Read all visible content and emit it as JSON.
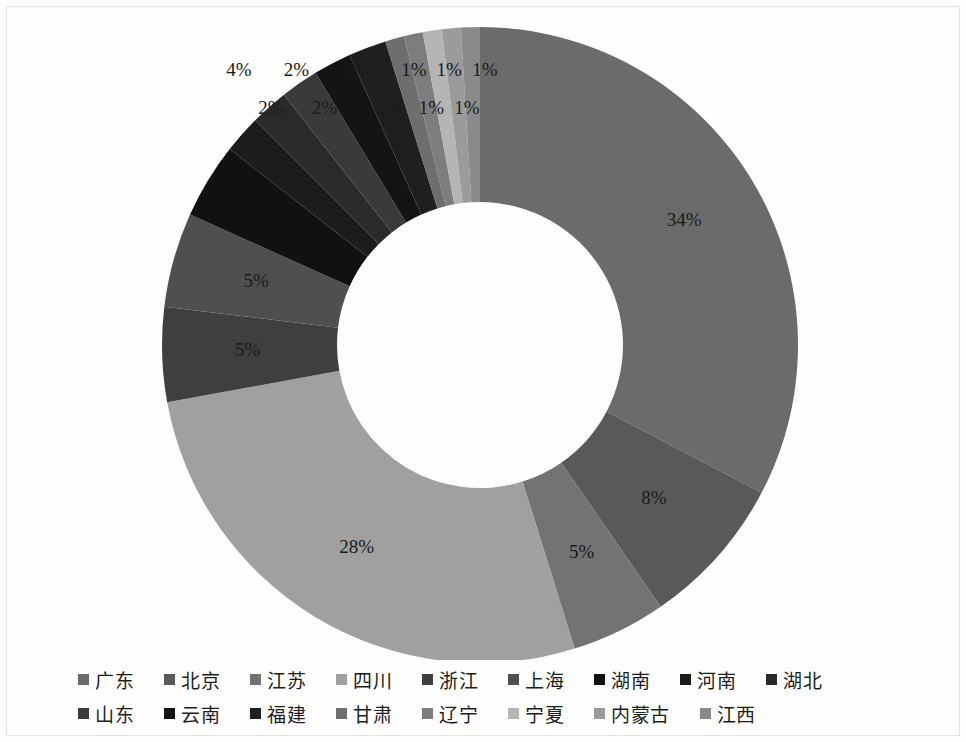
{
  "chart_data": {
    "type": "pie",
    "variant": "donut",
    "title": "",
    "xlabel": "",
    "ylabel": "",
    "units": "percent",
    "start_angle_deg": 0,
    "direction": "clockwise",
    "inner_radius_ratio": 0.45,
    "legend_position": "bottom",
    "grid": false,
    "categories": [
      "广东",
      "北京",
      "江苏",
      "四川",
      "浙江",
      "上海",
      "湖南",
      "河南",
      "湖北",
      "山东",
      "云南",
      "福建",
      "甘肃",
      "辽宁",
      "宁夏",
      "内蒙古",
      "江西"
    ],
    "values": [
      34,
      8,
      5,
      28,
      5,
      5,
      4,
      2,
      2,
      2,
      2,
      2,
      1,
      1,
      1,
      1,
      1
    ],
    "labels": [
      "34%",
      "8%",
      "5%",
      "28%",
      "5%",
      "5%",
      "4%",
      "2%",
      "2%",
      "2%",
      "2%",
      "2%",
      "1%",
      "1%",
      "1%",
      "1%",
      "1%"
    ],
    "label_visible": [
      true,
      true,
      true,
      true,
      true,
      true,
      true,
      true,
      true,
      true,
      true,
      true,
      true,
      true,
      true,
      true,
      true
    ],
    "colors": [
      "#6b6b6b",
      "#595959",
      "#737373",
      "#a0a0a0",
      "#3f3f3f",
      "#4f4f4f",
      "#111111",
      "#1c1c1c",
      "#2a2a2a",
      "#3a3a3a",
      "#141414",
      "#1f1f1f",
      "#6e6e6e",
      "#7d7d7d",
      "#b5b5b5",
      "#9b9b9b",
      "#8a8a8a"
    ]
  },
  "legend": {
    "row1": [
      {
        "label": "广东",
        "color": "#6b6b6b"
      },
      {
        "label": "北京",
        "color": "#595959"
      },
      {
        "label": "江苏",
        "color": "#737373"
      },
      {
        "label": "四川",
        "color": "#a0a0a0"
      },
      {
        "label": "浙江",
        "color": "#3f3f3f"
      },
      {
        "label": "上海",
        "color": "#4f4f4f"
      },
      {
        "label": "湖南",
        "color": "#111111"
      },
      {
        "label": "河南",
        "color": "#1c1c1c"
      },
      {
        "label": "湖北",
        "color": "#2a2a2a"
      }
    ],
    "row2": [
      {
        "label": "山东",
        "color": "#3a3a3a"
      },
      {
        "label": "云南",
        "color": "#141414"
      },
      {
        "label": "福建",
        "color": "#1f1f1f"
      },
      {
        "label": "甘肃",
        "color": "#6e6e6e"
      },
      {
        "label": "辽宁",
        "color": "#7d7d7d"
      },
      {
        "label": "宁夏",
        "color": "#b5b5b5"
      },
      {
        "label": "内蒙古",
        "color": "#9b9b9b"
      },
      {
        "label": "江西",
        "color": "#8a8a8a"
      }
    ]
  },
  "geometry": {
    "center_x": 480,
    "center_y": 345,
    "outer_radius": 318,
    "inner_radius": 143,
    "label_radius": 248
  }
}
